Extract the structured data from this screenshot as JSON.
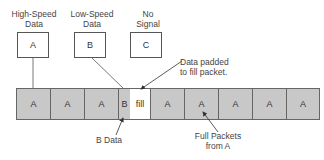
{
  "sources": [
    {
      "title_line1": "High-Speed",
      "title_line2": "Data",
      "letter": "A"
    },
    {
      "title_line1": "Low-Speed",
      "title_line2": "Data",
      "letter": "B"
    },
    {
      "title_line1": "No",
      "title_line2": "Signal",
      "letter": "C"
    }
  ],
  "strip": {
    "cells": [
      {
        "label": "A",
        "type": "full"
      },
      {
        "label": "A",
        "type": "full"
      },
      {
        "label": "A",
        "type": "full"
      },
      {
        "label": "B",
        "type": "partial"
      },
      {
        "label": "fill",
        "type": "fill"
      },
      {
        "label": "A",
        "type": "full"
      },
      {
        "label": "A",
        "type": "full"
      },
      {
        "label": "A",
        "type": "full"
      },
      {
        "label": "A",
        "type": "full"
      },
      {
        "label": "A",
        "type": "full"
      }
    ]
  },
  "annotations": {
    "padded_line1": "Data padded",
    "padded_line2": "to fill packet.",
    "bdata": "B Data",
    "full_line1": "Full Packets",
    "full_line2": "from A"
  }
}
